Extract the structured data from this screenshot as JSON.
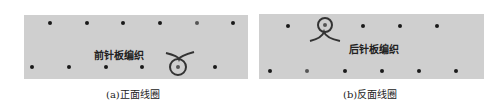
{
  "figures": [
    {
      "id": "a",
      "caption": "(a)正面线圈",
      "label": "前针板编织",
      "panel": {
        "x": 24,
        "y": 15,
        "w": 224,
        "h": 64
      },
      "top_row_dots_x": [
        50,
        87,
        123,
        160,
        197,
        233
      ],
      "top_row_y": 23,
      "bottom_row_dots_x": [
        32,
        69,
        106,
        142,
        215
      ],
      "bottom_row_y": 67,
      "loop": {
        "cx": 178,
        "cy": 67,
        "type": "front",
        "dot_grey": true
      },
      "label_pos": {
        "x": 94,
        "y": 48
      }
    },
    {
      "id": "b",
      "caption": "(b)反面线圈",
      "label": "后针板编织",
      "panel": {
        "x": 259,
        "y": 14,
        "w": 225,
        "h": 65
      },
      "top_row_dots_x": [
        288,
        363,
        400,
        437
      ],
      "top_row_y": 26,
      "bottom_row_dots_x": [
        270,
        307,
        345,
        382,
        419,
        456
      ],
      "bottom_row_y": 70,
      "loop": {
        "cx": 325,
        "cy": 25,
        "type": "back",
        "dot_grey": true
      },
      "label_pos": {
        "x": 349,
        "y": 42
      }
    }
  ],
  "colors": {
    "panel": "#cfcfcf",
    "dot": "#1a1a1a",
    "loop": "#333333"
  }
}
